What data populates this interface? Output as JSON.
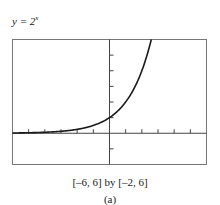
{
  "equation": {
    "lhs": "y = 2",
    "exponent": "x"
  },
  "window_label": "[–6, 6] by [–2, 6]",
  "sub_label": "(a)",
  "chart_data": {
    "type": "line",
    "xlabel": "",
    "ylabel": "",
    "xlim": [
      -6,
      6
    ],
    "ylim": [
      -2,
      6
    ],
    "xticks": [
      -6,
      -5,
      -4,
      -3,
      -2,
      -1,
      0,
      1,
      2,
      3,
      4,
      5,
      6
    ],
    "yticks": [
      -2,
      -1,
      0,
      1,
      2,
      3,
      4,
      5,
      6
    ],
    "grid": false,
    "legend": null,
    "series": [
      {
        "name": "y = 2^x",
        "x": [
          -6,
          -5,
          -4,
          -3,
          -2,
          -1,
          0,
          1,
          2,
          2.58
        ],
        "y": [
          0.016,
          0.031,
          0.063,
          0.125,
          0.25,
          0.5,
          1,
          2,
          4,
          6
        ]
      }
    ]
  }
}
